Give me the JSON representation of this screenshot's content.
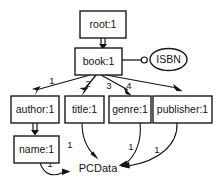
{
  "diagram": {
    "type": "dtd-graph",
    "title": "",
    "background_color": "#ffffff",
    "stroke_color": "#141414",
    "nodes": [
      {
        "id": "root",
        "label": "root:1",
        "shape": "rect",
        "x": 80,
        "y": 11,
        "w": 46,
        "h": 27
      },
      {
        "id": "book",
        "label": "book:1",
        "shape": "rect",
        "x": 75,
        "y": 48,
        "w": 47,
        "h": 27
      },
      {
        "id": "isbn",
        "label": "ISBN",
        "shape": "ellipse",
        "x": 150,
        "y": 48,
        "w": 37,
        "h": 22
      },
      {
        "id": "author",
        "label": "author:1",
        "shape": "rect",
        "x": 11,
        "y": 96,
        "w": 48,
        "h": 27
      },
      {
        "id": "title",
        "label": "title:1",
        "shape": "rect",
        "x": 65,
        "y": 96,
        "w": 39,
        "h": 27
      },
      {
        "id": "genre",
        "label": "genre:1",
        "shape": "rect",
        "x": 109,
        "y": 96,
        "w": 42,
        "h": 27
      },
      {
        "id": "publisher",
        "label": "publisher:1",
        "shape": "rect",
        "x": 153,
        "y": 96,
        "w": 59,
        "h": 27
      },
      {
        "id": "name",
        "label": "name:1",
        "shape": "rect",
        "x": 14,
        "y": 136,
        "w": 45,
        "h": 27
      },
      {
        "id": "pcdata",
        "label": "PCData",
        "shape": "plain",
        "x": 78,
        "y": 162,
        "w": 41,
        "h": 14
      }
    ],
    "edges": [
      {
        "id": "root-book",
        "from": "root",
        "to": "book",
        "style": "double",
        "label": ""
      },
      {
        "id": "book-isbn",
        "from": "book",
        "to": "isbn",
        "style": "attribute",
        "label": ""
      },
      {
        "id": "book-author",
        "from": "book",
        "to": "author",
        "style": "single",
        "label": "1"
      },
      {
        "id": "book-title",
        "from": "book",
        "to": "title",
        "style": "single",
        "label": "2"
      },
      {
        "id": "book-genre",
        "from": "book",
        "to": "genre",
        "style": "single",
        "label": "3"
      },
      {
        "id": "book-publisher",
        "from": "book",
        "to": "publisher",
        "style": "single",
        "label": "4"
      },
      {
        "id": "author-name",
        "from": "author",
        "to": "name",
        "style": "double",
        "label": ""
      },
      {
        "id": "name-pcdata",
        "from": "name",
        "to": "pcdata",
        "style": "curve",
        "label": "1"
      },
      {
        "id": "title-pcdata",
        "from": "title",
        "to": "pcdata",
        "style": "curve",
        "label": "1"
      },
      {
        "id": "genre-pcdata",
        "from": "genre",
        "to": "pcdata",
        "style": "curve",
        "label": "1"
      },
      {
        "id": "publisher-pcdata",
        "from": "publisher",
        "to": "pcdata",
        "style": "curve",
        "label": "1"
      }
    ],
    "edge_labels": [
      {
        "id": "lbl-book-author",
        "text": "1",
        "x": 52,
        "y": 81
      },
      {
        "id": "lbl-book-title",
        "text": "2",
        "x": 88,
        "y": 84
      },
      {
        "id": "lbl-book-genre",
        "text": "3",
        "x": 109,
        "y": 86
      },
      {
        "id": "lbl-book-publisher",
        "text": "4",
        "x": 129,
        "y": 86
      },
      {
        "id": "lbl-title-pcdata",
        "text": "1",
        "x": 70,
        "y": 145
      },
      {
        "id": "lbl-genre-pcdata",
        "text": "1",
        "x": 131,
        "y": 147
      },
      {
        "id": "lbl-publisher-pcdata",
        "text": "1",
        "x": 157,
        "y": 150
      },
      {
        "id": "lbl-name-pcdata",
        "text": "1",
        "x": 50,
        "y": 164
      }
    ]
  }
}
